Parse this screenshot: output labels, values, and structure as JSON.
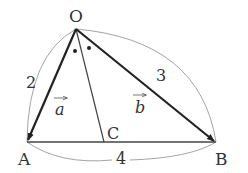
{
  "diagram": {
    "type": "triangle-vector-figure",
    "points": {
      "O": {
        "label": "O",
        "x": 76,
        "y": 29
      },
      "A": {
        "label": "A",
        "x": 27,
        "y": 142
      },
      "B": {
        "label": "B",
        "x": 216,
        "y": 142
      },
      "C": {
        "label": "C",
        "x": 104,
        "y": 142
      }
    },
    "lengths": {
      "OA": "2",
      "OB": "3",
      "AB": "4"
    },
    "vectors": {
      "a": {
        "label": "a",
        "from": "O",
        "to": "A"
      },
      "b": {
        "label": "b",
        "from": "O",
        "to": "B"
      }
    },
    "angle_marks": "equal angles AOC and COB (dots)",
    "colors": {
      "vector": "#222222",
      "line": "#444444",
      "arc": "#9a9a9a",
      "text": "#333333"
    }
  }
}
